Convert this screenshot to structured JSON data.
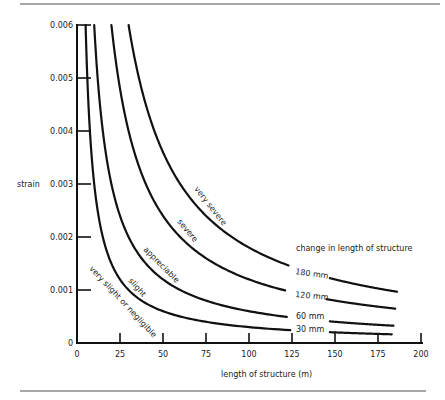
{
  "chart_data": {
    "type": "line",
    "title": "",
    "xlabel": "length of structure (m)",
    "ylabel": "strain",
    "xlim": [
      0,
      200
    ],
    "ylim": [
      0,
      0.006
    ],
    "x_ticks": [
      0,
      25,
      50,
      75,
      100,
      125,
      150,
      175,
      200
    ],
    "x_tick_labels": [
      "0",
      "25",
      "50",
      "75",
      "100",
      "125",
      "150",
      "175",
      "200"
    ],
    "y_ticks": [
      0,
      0.001,
      0.002,
      0.003,
      0.004,
      0.005,
      0.006
    ],
    "y_tick_labels": [
      "0",
      "0.001",
      "0.002",
      "0.003",
      "0.004",
      "0.005",
      "0.006"
    ],
    "grid": false,
    "legend_title": "change in length of structure",
    "relation": "strain = change_in_length / length_of_structure",
    "series": [
      {
        "name": "30 mm",
        "change_m": 0.03,
        "x_end": 183,
        "x": [
          5,
          10,
          25,
          50,
          75,
          100,
          125,
          150,
          183
        ],
        "values": [
          0.006,
          0.003,
          0.0012,
          0.0006,
          0.0004,
          0.0003,
          0.00024,
          0.0002,
          0.00016
        ]
      },
      {
        "name": "60 mm",
        "change_m": 0.06,
        "x_end": 184,
        "x": [
          10,
          20,
          25,
          50,
          75,
          100,
          125,
          150,
          184
        ],
        "values": [
          0.006,
          0.003,
          0.0024,
          0.0012,
          0.0008,
          0.0006,
          0.00048,
          0.0004,
          0.00033
        ]
      },
      {
        "name": "120 mm",
        "change_m": 0.12,
        "x_end": 185,
        "x": [
          20,
          25,
          50,
          75,
          100,
          125,
          150,
          185
        ],
        "values": [
          0.006,
          0.0048,
          0.0024,
          0.0016,
          0.0012,
          0.00096,
          0.0008,
          0.00065
        ]
      },
      {
        "name": "180 mm",
        "change_m": 0.18,
        "x_end": 186,
        "x": [
          30,
          50,
          75,
          100,
          125,
          150,
          186
        ],
        "values": [
          0.006,
          0.0036,
          0.0024,
          0.0018,
          0.00144,
          0.0012,
          0.00097
        ]
      }
    ],
    "damage_zones": [
      "very slight or negligible",
      "slight",
      "appreciable",
      "severe",
      "very severe"
    ]
  },
  "labels": {
    "ylabel": "strain",
    "xlabel": "length of structure (m)",
    "legend_title": "change in length of structure",
    "zone_very_slight": "very slight or negligible",
    "zone_slight": "slight",
    "zone_appreciable": "appreciable",
    "zone_severe": "severe",
    "zone_very_severe": "very severe",
    "mm_180": "180 mm",
    "mm_120": "120 mm",
    "mm_60": "60 mm",
    "mm_30": "30 mm"
  },
  "colors": {
    "ink": "#111111",
    "rule": "#8a8a8a",
    "background": "#ffffff"
  }
}
